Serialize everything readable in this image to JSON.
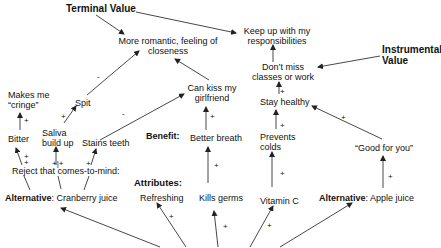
{
  "labels": {
    "terminal_value": "Terminal Value",
    "instrumental_value_line1": "Instrumental",
    "instrumental_value_line2": "Value",
    "benefit": "Benefit:",
    "attributes": "Attributes:"
  },
  "nodes": {
    "romantic_line1": "More romantic, feeling of",
    "romantic_line2": "closeness",
    "responsibilities_line1": "Keep up with my",
    "responsibilities_line2": "responsibilities",
    "dont_miss_line1": "Don’t miss",
    "dont_miss_line2": "classes or work",
    "stay_healthy": "Stay healthy",
    "prevents_colds_line1": "Prevents",
    "prevents_colds_line2": "colds",
    "good_for_you": "“Good for you”",
    "can_kiss_line1": "Can kiss my",
    "can_kiss_line2": "girlfriend",
    "better_breath": "Better breath",
    "makes_cringe_line1": "Makes me",
    "makes_cringe_line2": "“cringe”",
    "spit": "Spit",
    "bitter": "Bitter",
    "saliva_line1": "Saliva",
    "saliva_line2": "build up",
    "stains_teeth": "Stains teeth",
    "reject": "Reject that comes-to-mind:",
    "refreshing": "Refreshing",
    "kills_germs": "Kills germs",
    "vitamin_c": "Vitamin C"
  },
  "alternatives": {
    "left_label": "Alternative",
    "left_value": ": Cranberry juice",
    "right_label": "Alternative",
    "right_value": ": Apple juice"
  },
  "signs": {
    "plus": "+",
    "minus": "-",
    "plus_plus": "+|+"
  },
  "colors": {
    "line": "#333333",
    "text": "#111111",
    "background": "#ffffff"
  }
}
